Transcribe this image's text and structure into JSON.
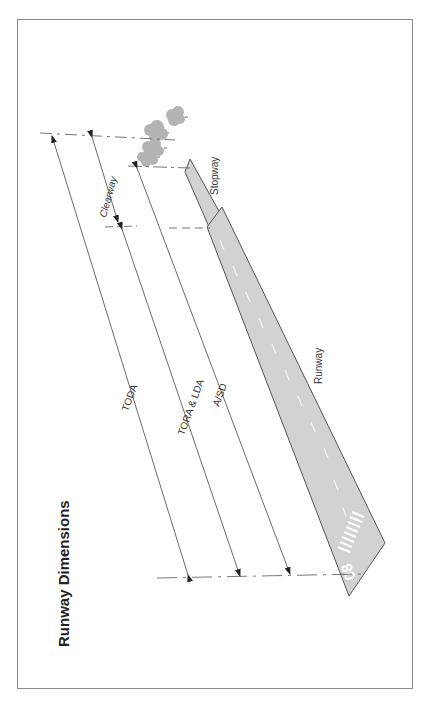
{
  "title": "Runway Dimensions",
  "labels": {
    "toda": "TODA",
    "tora_lda": "TORA & LDA",
    "asd": "A/SD",
    "clearway": "Clearway",
    "stopway": "Stopway",
    "runway": "Runway",
    "runway_number": "08"
  },
  "colors": {
    "frame": "#8a8a8a",
    "runway_fill": "#d2d2d2",
    "runway_stroke": "#555555",
    "lines": "#444444",
    "trees": "#b4b4b4",
    "markings": "#ffffff"
  }
}
